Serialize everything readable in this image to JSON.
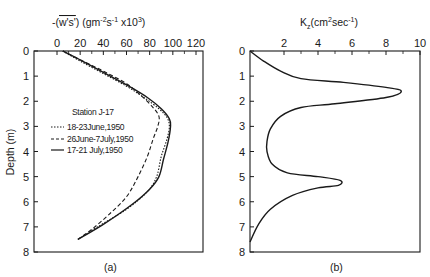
{
  "chart_data": [
    {
      "panel": "(a)",
      "type": "line",
      "title": "",
      "xlabel": "-(w's') (gm^-2 s^-1 x10^3)",
      "xlabel_parts": {
        "prefix": "-(",
        "overlined": "w's'",
        "suffix": ") (gm",
        "sup1": "-2",
        "mid": "s",
        "sup2": "-1",
        "tail": " x10",
        "sup3": "3",
        "close": ")"
      },
      "ylabel": "Depth (m)",
      "xlim": [
        0,
        120
      ],
      "ylim": [
        8,
        0
      ],
      "x_ticks": [
        0,
        20,
        40,
        60,
        80,
        100,
        120
      ],
      "y_ticks": [
        0,
        1,
        2,
        3,
        4,
        5,
        6,
        7,
        8
      ],
      "x_axis_position": "top",
      "grid": false,
      "legend_title": "Station J-17",
      "legend_position": "center-left",
      "series": [
        {
          "name": "18-23June,1950",
          "style": "dotted",
          "points": [
            [
              5,
              0
            ],
            [
              20,
              0.4
            ],
            [
              40,
              0.9
            ],
            [
              60,
              1.4
            ],
            [
              75,
              1.85
            ],
            [
              88,
              2.3
            ],
            [
              95,
              2.65
            ],
            [
              97,
              3.0
            ],
            [
              95,
              3.5
            ],
            [
              90,
              4.2
            ],
            [
              86,
              5.0
            ],
            [
              78,
              5.6
            ],
            [
              60,
              6.3
            ],
            [
              35,
              7.0
            ],
            [
              18,
              7.5
            ]
          ]
        },
        {
          "name": "26June-7July,1950",
          "style": "dashed",
          "points": [
            [
              5,
              0
            ],
            [
              20,
              0.35
            ],
            [
              40,
              0.8
            ],
            [
              60,
              1.3
            ],
            [
              72,
              1.75
            ],
            [
              82,
              2.2
            ],
            [
              88,
              2.6
            ],
            [
              87,
              3.0
            ],
            [
              83,
              3.5
            ],
            [
              78,
              4.2
            ],
            [
              70,
              5.0
            ],
            [
              60,
              5.8
            ],
            [
              45,
              6.5
            ],
            [
              30,
              7.1
            ],
            [
              18,
              7.5
            ]
          ]
        },
        {
          "name": "17-21 July,1950",
          "style": "solid",
          "points": [
            [
              5,
              0
            ],
            [
              22,
              0.4
            ],
            [
              42,
              0.9
            ],
            [
              62,
              1.4
            ],
            [
              78,
              1.85
            ],
            [
              90,
              2.3
            ],
            [
              97,
              2.7
            ],
            [
              98,
              3.0
            ],
            [
              96,
              3.6
            ],
            [
              92,
              4.3
            ],
            [
              88,
              5.0
            ],
            [
              80,
              5.5
            ],
            [
              65,
              6.1
            ],
            [
              40,
              6.9
            ],
            [
              18,
              7.5
            ]
          ]
        }
      ]
    },
    {
      "panel": "(b)",
      "type": "line",
      "title": "",
      "xlabel": "Kz (cm^2 sec^-1)",
      "xlabel_parts": {
        "base": "K",
        "sub": "z",
        "unit_prefix": "(cm",
        "sup1": "2",
        "mid": "sec",
        "sup2": "-1",
        "close": ")"
      },
      "ylabel": "",
      "xlim": [
        0,
        10
      ],
      "ylim": [
        8,
        0
      ],
      "x_ticks": [
        2,
        4,
        6,
        8,
        10
      ],
      "x_tick_zero_label": "0",
      "y_ticks": [
        0,
        1,
        2,
        3,
        4,
        5,
        6,
        7,
        8
      ],
      "x_axis_position": "top",
      "grid": false,
      "series": [
        {
          "name": "Kz",
          "style": "solid",
          "points": [
            [
              0,
              0
            ],
            [
              0.8,
              0.4
            ],
            [
              1.8,
              0.8
            ],
            [
              3.0,
              1.1
            ],
            [
              5.5,
              1.25
            ],
            [
              8.0,
              1.45
            ],
            [
              8.9,
              1.6
            ],
            [
              8.0,
              1.85
            ],
            [
              5.0,
              2.1
            ],
            [
              3.0,
              2.25
            ],
            [
              1.8,
              2.6
            ],
            [
              1.2,
              3.1
            ],
            [
              1.0,
              3.6
            ],
            [
              1.0,
              4.0
            ],
            [
              1.3,
              4.5
            ],
            [
              2.2,
              4.85
            ],
            [
              4.0,
              5.0
            ],
            [
              5.3,
              5.15
            ],
            [
              5.2,
              5.35
            ],
            [
              4.0,
              5.45
            ],
            [
              2.5,
              5.75
            ],
            [
              1.2,
              6.3
            ],
            [
              0.5,
              6.9
            ],
            [
              0,
              7.6
            ]
          ]
        }
      ]
    }
  ],
  "panels": {
    "a": {
      "label": "(a)",
      "y_tick_labels": [
        "0",
        "1",
        "2",
        "3",
        "4",
        "5",
        "6",
        "7",
        "8"
      ],
      "x_tick_labels": [
        "0",
        "20",
        "40",
        "60",
        "80",
        "100",
        "120"
      ],
      "ylabel": "Depth (m)",
      "legend": {
        "title": "Station J-17",
        "items": [
          {
            "label": "18-23June,1950",
            "style": "dotted"
          },
          {
            "label": "26June-7July,1950",
            "style": "dashed"
          },
          {
            "label": "17-21 July,1950",
            "style": "solid"
          }
        ]
      }
    },
    "b": {
      "label": "(b)",
      "y_tick_labels": [
        "0",
        "1",
        "2",
        "3",
        "4",
        "5",
        "6",
        "7",
        "8"
      ],
      "x_tick_labels": [
        "2",
        "4",
        "6",
        "8",
        "10"
      ]
    }
  },
  "colors": {
    "ink": "#1a1a1a",
    "background": "#ffffff"
  }
}
